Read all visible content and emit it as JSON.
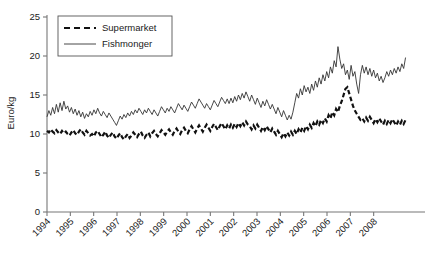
{
  "chart_data": {
    "type": "line",
    "title": "",
    "xlabel": "",
    "ylabel": "Euro/kg",
    "ylim": [
      0,
      25
    ],
    "yticks": [
      0,
      5,
      10,
      15,
      20,
      25
    ],
    "xlim": [
      1994,
      2009
    ],
    "xticks": [
      1994,
      1995,
      1996,
      1997,
      1998,
      1999,
      2000,
      2001,
      2002,
      2003,
      2004,
      2005,
      2006,
      2007,
      2008
    ],
    "xtick_labels": [
      "1994",
      "1995",
      "1996",
      "1997",
      "1998",
      "1999",
      "2000",
      "2001",
      "2002",
      "2003",
      "2004",
      "2005",
      "2006",
      "2007",
      "2008"
    ],
    "xtick_rotation": 45,
    "grid": false,
    "legend_position": "top-left",
    "colors": {
      "supermarket": "#111111",
      "fishmonger": "#333333",
      "axis": "#777777",
      "text": "#1a1a1a"
    },
    "x_start": 1994.0,
    "x_step": 0.08333,
    "series": [
      {
        "name": "Supermarket",
        "style": "dashed",
        "width": 2.2,
        "values": [
          10.4,
          10.2,
          10.6,
          10.3,
          10.1,
          10.5,
          10.2,
          10.0,
          10.4,
          10.1,
          10.3,
          10.0,
          9.8,
          10.2,
          10.5,
          10.1,
          9.9,
          10.3,
          10.6,
          10.2,
          9.9,
          10.4,
          10.1,
          9.8,
          10.0,
          9.7,
          10.2,
          10.4,
          10.0,
          9.6,
          9.9,
          10.3,
          9.8,
          9.5,
          9.9,
          10.2,
          9.7,
          9.4,
          9.8,
          10.1,
          9.6,
          9.3,
          9.7,
          10.0,
          9.5,
          9.8,
          10.2,
          9.9,
          9.6,
          10.0,
          10.3,
          9.8,
          9.5,
          9.9,
          10.2,
          9.7,
          10.1,
          10.4,
          10.0,
          9.7,
          10.1,
          10.5,
          10.2,
          9.9,
          10.3,
          10.6,
          10.2,
          9.9,
          10.4,
          10.7,
          10.3,
          10.0,
          10.5,
          10.8,
          10.4,
          10.1,
          10.6,
          11.0,
          10.6,
          10.2,
          10.7,
          11.1,
          10.7,
          10.3,
          10.8,
          11.2,
          10.8,
          10.4,
          10.9,
          11.3,
          10.9,
          10.5,
          11.0,
          11.4,
          11.0,
          10.6,
          11.1,
          10.7,
          11.2,
          10.8,
          11.3,
          10.9,
          11.4,
          11.0,
          11.5,
          11.1,
          11.6,
          11.2,
          11.0,
          10.6,
          11.1,
          10.7,
          11.2,
          10.8,
          10.4,
          10.9,
          10.5,
          11.0,
          10.6,
          10.2,
          10.7,
          10.3,
          9.9,
          10.4,
          10.0,
          9.6,
          10.1,
          9.7,
          10.2,
          9.8,
          10.3,
          9.9,
          10.4,
          10.0,
          10.6,
          10.2,
          10.8,
          10.4,
          11.0,
          10.6,
          11.2,
          10.8,
          11.4,
          11.0,
          11.6,
          11.2,
          11.8,
          11.4,
          12.0,
          11.6,
          12.4,
          12.0,
          12.8,
          12.4,
          13.2,
          12.8,
          13.6,
          14.2,
          15.0,
          15.8,
          16.0,
          15.2,
          14.4,
          13.6,
          13.0,
          12.6,
          12.2,
          11.8,
          12.0,
          11.6,
          12.1,
          11.7,
          12.2,
          11.8,
          11.4,
          11.9,
          11.5,
          12.0,
          11.6,
          11.2,
          11.7,
          11.3,
          11.8,
          11.4,
          11.9,
          11.5,
          11.1,
          11.6,
          11.2,
          11.7,
          11.3,
          11.8
        ]
      },
      {
        "name": "Fishmonger",
        "style": "solid",
        "width": 0.9,
        "values": [
          12.2,
          13.0,
          12.4,
          13.4,
          12.6,
          13.8,
          12.8,
          14.0,
          13.0,
          14.2,
          13.2,
          13.6,
          12.8,
          13.4,
          12.6,
          13.2,
          12.4,
          13.0,
          12.2,
          12.8,
          12.0,
          12.6,
          12.2,
          12.9,
          12.4,
          13.1,
          12.6,
          13.3,
          12.7,
          12.3,
          12.9,
          12.5,
          12.1,
          12.7,
          12.3,
          11.9,
          11.5,
          11.1,
          11.7,
          12.3,
          11.9,
          12.5,
          12.1,
          12.7,
          12.3,
          12.9,
          12.5,
          13.1,
          12.7,
          13.3,
          12.9,
          12.5,
          13.1,
          12.7,
          13.3,
          12.9,
          12.5,
          13.1,
          12.7,
          12.3,
          12.9,
          13.5,
          13.1,
          12.7,
          13.3,
          12.9,
          13.5,
          13.1,
          12.7,
          13.3,
          13.9,
          13.5,
          13.1,
          13.7,
          13.3,
          12.9,
          13.5,
          14.1,
          13.7,
          13.3,
          13.9,
          14.5,
          14.1,
          13.7,
          13.3,
          13.9,
          13.5,
          13.1,
          13.7,
          14.3,
          13.9,
          13.5,
          14.1,
          14.7,
          14.3,
          13.9,
          14.5,
          13.9,
          14.6,
          14.0,
          14.8,
          14.2,
          15.0,
          14.4,
          15.2,
          14.6,
          15.4,
          14.8,
          14.2,
          15.0,
          14.4,
          13.8,
          14.6,
          14.0,
          13.4,
          14.2,
          13.6,
          14.4,
          13.8,
          13.2,
          13.8,
          13.2,
          12.6,
          13.4,
          12.8,
          12.2,
          13.0,
          12.4,
          11.8,
          12.4,
          11.9,
          12.8,
          14.0,
          15.2,
          14.6,
          15.8,
          15.0,
          16.2,
          15.4,
          16.0,
          15.2,
          16.4,
          15.6,
          16.8,
          16.0,
          17.2,
          16.4,
          17.6,
          16.8,
          18.0,
          17.2,
          18.6,
          17.8,
          19.4,
          18.6,
          21.2,
          19.6,
          18.4,
          19.0,
          17.6,
          18.2,
          17.0,
          18.8,
          17.4,
          18.0,
          16.4,
          15.2,
          17.6,
          18.8,
          17.8,
          18.6,
          17.6,
          18.4,
          17.4,
          18.2,
          17.2,
          17.8,
          16.8,
          17.4,
          16.6,
          17.2,
          18.0,
          17.4,
          18.2,
          17.6,
          18.4,
          17.8,
          18.6,
          18.0,
          19.0,
          18.4,
          19.8
        ]
      }
    ]
  },
  "legend": {
    "items": [
      {
        "label": "Supermarket",
        "style": "dashed"
      },
      {
        "label": "Fishmonger",
        "style": "solid"
      }
    ]
  },
  "axes": {
    "y_label": "Euro/kg",
    "y_ticks": [
      "0",
      "5",
      "10",
      "15",
      "20",
      "25"
    ],
    "x_ticks": [
      "1994",
      "1995",
      "1996",
      "1997",
      "1998",
      "1999",
      "2000",
      "2001",
      "2002",
      "2003",
      "2004",
      "2005",
      "2006",
      "2007",
      "2008"
    ]
  }
}
